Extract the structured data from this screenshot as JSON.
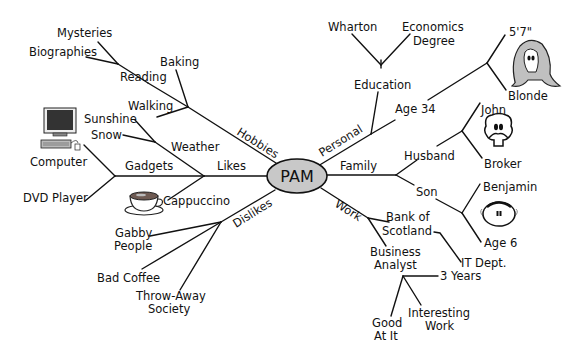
{
  "center": {
    "label": "PAM",
    "fill": "#c8c8c8"
  },
  "branches": {
    "hobbies": {
      "label": "Hobbies",
      "reading": {
        "label": "Reading",
        "children": [
          "Mysteries",
          "Biographies"
        ]
      },
      "baking": "Baking",
      "walking": "Walking"
    },
    "likes": {
      "label": "Likes",
      "weather": {
        "label": "Weather",
        "children": [
          "Sunshine",
          "Snow"
        ]
      },
      "gadgets": {
        "label": "Gadgets",
        "children": [
          "Computer",
          "DVD Player"
        ]
      },
      "cappuccino": "Cappuccino"
    },
    "dislikes": {
      "label": "Dislikes",
      "children": [
        "Gabby",
        "People",
        "Bad Coffee",
        "Throw-Away",
        "Society"
      ]
    },
    "personal": {
      "label": "Personal",
      "education": {
        "label": "Education",
        "children": [
          "Wharton",
          "Economics",
          "Degree"
        ]
      },
      "age": {
        "label": "Age 34",
        "children": [
          "5'7\"",
          "Blonde"
        ]
      }
    },
    "family": {
      "label": "Family",
      "husband": {
        "label": "Husband",
        "children": [
          "John",
          "Broker"
        ]
      },
      "son": {
        "label": "Son",
        "children": [
          "Benjamin",
          "Age 6"
        ]
      }
    },
    "work": {
      "label": "Work",
      "employer": {
        "line1": "Bank of",
        "line2": "Scotland",
        "dept": "IT Dept."
      },
      "role": {
        "line1": "Business",
        "line2": "Analyst",
        "children": [
          "3 Years",
          "Interesting",
          "Work",
          "Good",
          "At It"
        ]
      }
    }
  },
  "icons": [
    "computer-icon",
    "coffee-cup-icon",
    "woman-face-icon",
    "man-face-icon",
    "baby-face-icon"
  ]
}
